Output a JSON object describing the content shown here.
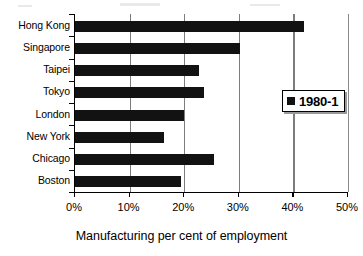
{
  "chart_data": {
    "type": "bar",
    "orientation": "horizontal",
    "title": "",
    "xlabel": "Manufacturing per cent of employment",
    "ylabel": "",
    "categories": [
      "Hong Kong",
      "Singapore",
      "Taipei",
      "Tokyo",
      "London",
      "New York",
      "Chicago",
      "Boston"
    ],
    "values": [
      42.0,
      30.2,
      22.7,
      23.7,
      20.0,
      16.3,
      25.4,
      19.5
    ],
    "series": [
      {
        "name": "1980-1",
        "values": [
          42.0,
          30.2,
          22.7,
          23.7,
          20.0,
          16.3,
          25.4,
          19.5
        ],
        "color": "#121212"
      }
    ],
    "xlim": [
      0,
      50
    ],
    "xticks": [
      0,
      10,
      20,
      30,
      40,
      50
    ],
    "xtick_labels": [
      "0%",
      "10%",
      "20%",
      "30%",
      "40%",
      "50%"
    ],
    "grid": "vertical",
    "legend": {
      "position": "inside-right",
      "entries": [
        {
          "label": "1980-1",
          "marker": "square",
          "color": "#121212"
        }
      ]
    }
  },
  "legend": {
    "label": "1980-1"
  },
  "axis": {
    "title": "Manufacturing per cent of employment"
  }
}
